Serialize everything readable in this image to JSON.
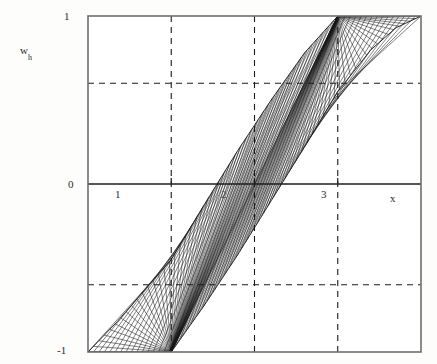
{
  "chart_data": {
    "type": "line",
    "title": "",
    "subtitle": "",
    "xlabel": "x",
    "ylabel": "w_h",
    "ylabel_base": "w",
    "ylabel_sub": "h",
    "xlim": [
      0,
      4
    ],
    "ylim": [
      -1,
      1
    ],
    "grid": true,
    "grid_style": "dashed",
    "legend": "none",
    "x_ticks": [
      {
        "value": 1,
        "label": "1"
      },
      {
        "value": 2,
        "label": "2"
      },
      {
        "value": 3,
        "label": "3"
      }
    ],
    "y_ticks": [
      {
        "value": -1,
        "label": "-1"
      },
      {
        "value": 0,
        "label": "0"
      },
      {
        "value": 1,
        "label": "1"
      }
    ],
    "x_gridlines": [
      1,
      2,
      3
    ],
    "y_gridlines": [
      -0.6,
      0.6
    ],
    "axis_lines": [
      {
        "orientation": "horizontal",
        "value": 0
      }
    ],
    "series": [
      {
        "name": "lower envelope",
        "comment": "Lower boundary of the hatched band",
        "x": [
          0.0,
          0.35,
          0.7,
          1.0,
          1.4,
          1.8,
          2.2,
          2.6,
          3.0,
          3.4,
          3.7,
          4.0
        ],
        "values": [
          -1.0,
          -1.0,
          -1.0,
          -1.0,
          -0.72,
          -0.42,
          -0.1,
          0.22,
          0.55,
          0.8,
          0.93,
          1.0
        ]
      },
      {
        "name": "upper envelope",
        "comment": "Upper boundary of the hatched band",
        "x": [
          0.0,
          0.35,
          0.7,
          1.0,
          1.4,
          1.8,
          2.2,
          2.6,
          3.0,
          3.4,
          3.7,
          4.0
        ],
        "values": [
          -1.0,
          -0.82,
          -0.62,
          -0.45,
          -0.12,
          0.2,
          0.5,
          0.78,
          1.0,
          1.0,
          1.0,
          1.0
        ]
      }
    ],
    "fan_lines": {
      "count": 46,
      "lower_anchor": {
        "x": 1.0,
        "y": -1.0
      },
      "upper_anchor": {
        "x": 3.0,
        "y": 1.0
      },
      "comment": "Straight chords sweeping across the band between the two saturation corners"
    },
    "colors": {
      "frame": "#6e6e6e",
      "axis": "#1c1c1c",
      "grid": "#1c1c1c",
      "curve": "#1a1a1a",
      "background": "#fdfdfc",
      "text": "#2b2b2b"
    }
  },
  "axes_geometry": {
    "frame_left_px": 88,
    "frame_right_px": 421,
    "frame_top_px": 16,
    "frame_bottom_px": 352
  }
}
